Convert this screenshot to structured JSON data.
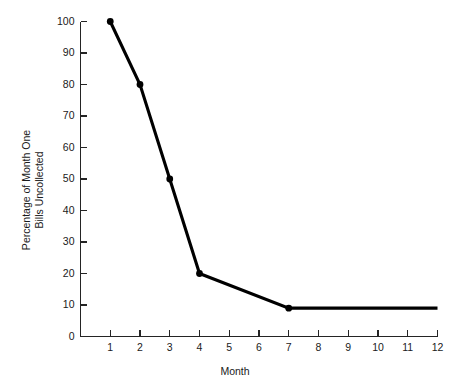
{
  "chart_data": {
    "type": "line",
    "title": "",
    "xlabel": "Month",
    "ylabel": "Percentage of Month One Bills Uncollected",
    "ylabel_line1": "Percentage of Month One",
    "ylabel_line2": "Bills Uncollected",
    "x": [
      1,
      2,
      3,
      4,
      7,
      12
    ],
    "values": [
      100,
      80,
      50,
      20,
      9,
      9
    ],
    "markers_at_x": [
      1,
      2,
      3,
      4,
      7
    ],
    "series": [
      {
        "name": "Percentage of Month One Bills Uncollected",
        "x": [
          1,
          2,
          3,
          4,
          7,
          12
        ],
        "values": [
          100,
          80,
          50,
          20,
          9,
          9
        ],
        "color": "#000000",
        "marker": "filled-circle"
      }
    ],
    "xlim": [
      0,
      12
    ],
    "ylim": [
      0,
      100
    ],
    "xticks": [
      1,
      2,
      3,
      4,
      5,
      6,
      7,
      8,
      9,
      10,
      11,
      12
    ],
    "xtick_labels": [
      "1",
      "2",
      "3",
      "4",
      "5",
      "6",
      "7",
      "8",
      "9",
      "10",
      "11",
      "12"
    ],
    "yticks": [
      0,
      10,
      20,
      30,
      40,
      50,
      60,
      70,
      80,
      90,
      100
    ],
    "ytick_labels": [
      "0",
      "10",
      "20",
      "30",
      "40",
      "50",
      "60",
      "70",
      "80",
      "90",
      "100"
    ],
    "grid": false,
    "legend": false,
    "legend_position": "none",
    "background_color": "#ffffff",
    "axis_color": "#242424",
    "line_color": "#000000"
  }
}
